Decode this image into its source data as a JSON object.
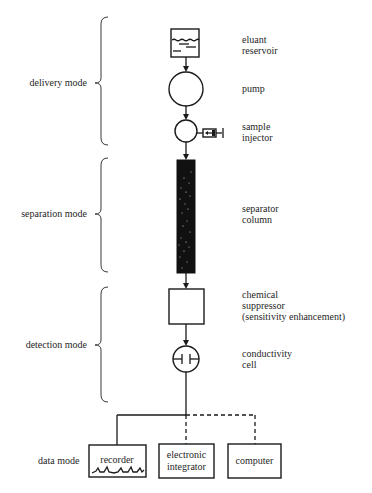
{
  "modes": [
    {
      "id": "delivery",
      "label": "delivery mode"
    },
    {
      "id": "separation",
      "label": "separation mode"
    },
    {
      "id": "detection",
      "label": "detection mode"
    },
    {
      "id": "data",
      "label": "data mode"
    }
  ],
  "components": {
    "reservoir": {
      "lines": [
        "eluant",
        "reservoir"
      ],
      "icon": "reservoir-icon"
    },
    "pump": {
      "lines": [
        "pump"
      ],
      "icon": "pump-circle-icon"
    },
    "injector": {
      "lines": [
        "sample",
        "injector"
      ],
      "icon": "syringe-icon"
    },
    "column": {
      "lines": [
        "separator",
        "column"
      ],
      "icon": "packed-column-icon"
    },
    "suppressor": {
      "lines": [
        "chemical",
        "suppressor",
        "(sensitivity enhancement)"
      ],
      "icon": "suppressor-box-icon"
    },
    "cell": {
      "lines": [
        "conductivity",
        "cell"
      ],
      "icon": "electrode-cell-icon"
    }
  },
  "outputs": [
    {
      "id": "recorder",
      "lines": [
        "recorder"
      ],
      "connection": "solid"
    },
    {
      "id": "integrator",
      "lines": [
        "electronic",
        "integrator"
      ],
      "connection": "dashed"
    },
    {
      "id": "computer",
      "lines": [
        "computer"
      ],
      "connection": "dashed"
    }
  ],
  "colors": {
    "ink": "#1a1a1a",
    "column_fill": "#111111",
    "background": "#ffffff"
  }
}
